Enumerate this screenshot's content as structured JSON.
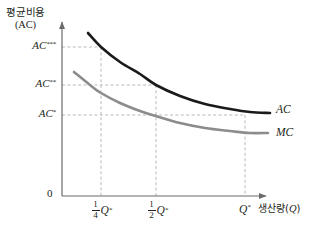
{
  "chart_data": {
    "type": "line",
    "title": "",
    "ylabel_ko": "평균비용",
    "ylabel_paren": "(AC)",
    "xlabel_ko": "생산량",
    "xlabel_paren_open": "(",
    "xlabel_var": "Q",
    "xlabel_paren_close": ")",
    "origin_label": "0",
    "grid": "dashed-guides",
    "legend_position": "right-of-curve-ends",
    "y_ticks": [
      {
        "id": "ac1",
        "base": "AC",
        "stars": "*",
        "label": "AC*",
        "y_px": 115
      },
      {
        "id": "ac2",
        "base": "AC",
        "stars": "**",
        "label": "AC**",
        "y_px": 85
      },
      {
        "id": "ac3",
        "base": "AC",
        "stars": "***",
        "label": "AC***",
        "y_px": 47
      }
    ],
    "x_ticks": [
      {
        "id": "quarter",
        "numerator": "1",
        "denominator": "4",
        "var": "Q",
        "star": "*",
        "label": "1/4 Q*",
        "x_px": 101
      },
      {
        "id": "half",
        "numerator": "1",
        "denominator": "2",
        "var": "Q",
        "star": "*",
        "label": "1/2 Q*",
        "x_px": 156
      },
      {
        "id": "qstar",
        "numerator": "",
        "denominator": "",
        "var": "Q",
        "star": "*",
        "label": "Q*",
        "x_px": 245
      }
    ],
    "series": [
      {
        "name": "AC",
        "label": "AC",
        "color": "#1a1a1a",
        "width": 2.6,
        "description": "average cost curve, decreasing convex",
        "points": [
          [
            88,
            33
          ],
          [
            101,
            47
          ],
          [
            120,
            62
          ],
          [
            140,
            74
          ],
          [
            156,
            85
          ],
          [
            180,
            96
          ],
          [
            205,
            104
          ],
          [
            230,
            109
          ],
          [
            250,
            112
          ],
          [
            270,
            113
          ]
        ]
      },
      {
        "name": "MC",
        "label": "MC",
        "color": "#8c8c8c",
        "width": 2.6,
        "description": "marginal cost curve, decreasing convex, below AC",
        "points": [
          [
            74,
            72
          ],
          [
            90,
            85
          ],
          [
            101,
            93
          ],
          [
            120,
            103
          ],
          [
            140,
            111
          ],
          [
            156,
            116
          ],
          [
            180,
            123
          ],
          [
            205,
            128
          ],
          [
            230,
            131
          ],
          [
            250,
            133
          ],
          [
            268,
            133
          ]
        ]
      }
    ],
    "guide_lines": {
      "horizontal": [
        {
          "tick": "ac3",
          "y_px": 47,
          "from_x": 62,
          "to_x": 101
        },
        {
          "tick": "ac2",
          "y_px": 85,
          "from_x": 62,
          "to_x": 156
        },
        {
          "tick": "ac1",
          "y_px": 115,
          "from_x": 62,
          "to_x": 245
        }
      ],
      "vertical": [
        {
          "tick": "quarter",
          "x_px": 101,
          "from_y": 47,
          "to_y": 196
        },
        {
          "tick": "half",
          "x_px": 156,
          "from_y": 85,
          "to_y": 196
        },
        {
          "tick": "qstar",
          "x_px": 245,
          "from_y": 115,
          "to_y": 196
        }
      ]
    },
    "axes": {
      "x_axis_y_px": 196,
      "y_axis_x_px": 62,
      "x_axis_end_px": 272,
      "y_axis_top_px": 18,
      "color": "#6b6b6b"
    },
    "colors": {
      "ac_curve": "#1a1a1a",
      "mc_curve": "#8c8c8c",
      "axis": "#6b6b6b",
      "guide": "#b0b0b0",
      "text": "#231f20",
      "background": "#ffffff"
    }
  }
}
